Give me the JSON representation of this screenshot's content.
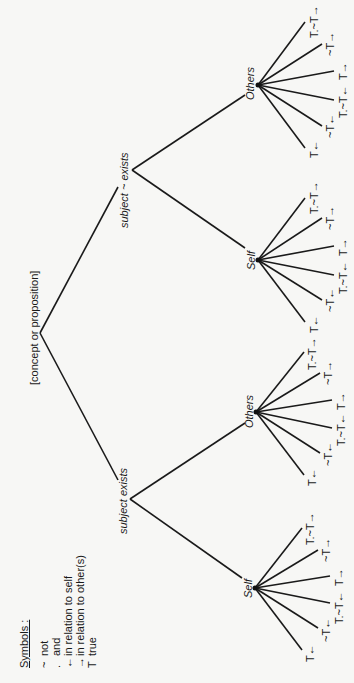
{
  "diagram": {
    "orientation": "rotated 90 degrees counter-clockwise",
    "root": {
      "label": "[concept or proposition]"
    },
    "branches": [
      {
        "label": "subject exists",
        "children": [
          {
            "label": "Self",
            "leaves": [
              "T←",
              "~T←",
              "T.~T←",
              "T→",
              "~T→",
              "T.~T→"
            ]
          },
          {
            "label": "Others",
            "leaves": [
              "T←",
              "~T←",
              "T.~T←",
              "T→",
              "~T→",
              "T.~T→"
            ]
          }
        ]
      },
      {
        "label": "subject ~ exists",
        "children": [
          {
            "label": "Self",
            "leaves": [
              "T←",
              "~T←",
              "T.~T←",
              "T→",
              "~T→",
              "T.~T→"
            ]
          },
          {
            "label": "Others",
            "leaves": [
              "T←",
              "~T←",
              "T.~T←",
              "T→",
              "~T→",
              "T.~T→"
            ]
          }
        ]
      }
    ]
  },
  "legend": {
    "title": "Symbols :",
    "items": [
      {
        "symbol": "~",
        "meaning": "not"
      },
      {
        "symbol": ".",
        "meaning": "and"
      },
      {
        "symbol": "←",
        "meaning": "in relation to self"
      },
      {
        "symbol": "→",
        "meaning": "in relation to other(s)"
      },
      {
        "symbol": "T",
        "meaning": "true"
      }
    ]
  },
  "colors": {
    "background": "#f7f7f5",
    "ink": "#1a1a1a"
  }
}
